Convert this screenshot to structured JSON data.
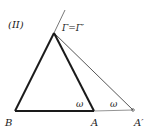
{
  "figure": {
    "panel_label": "(II)",
    "apex_label": "Γ=Γ′",
    "vertex_B": "B",
    "vertex_A": "A",
    "vertex_A_prime": "A′",
    "angle_at_A": "ω",
    "angle_at_A_prime": "ω"
  },
  "colors": {
    "stroke": "#1a1a1a",
    "thin_stroke": "#444444",
    "background": "#ffffff"
  }
}
